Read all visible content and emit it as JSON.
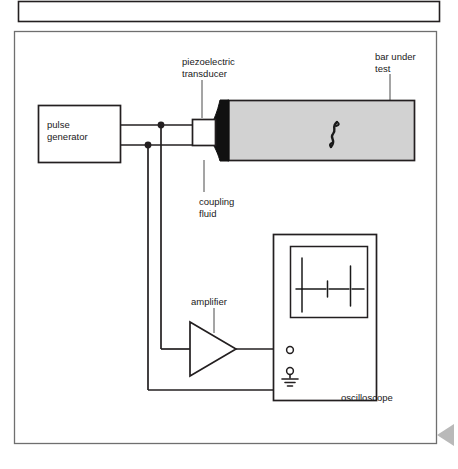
{
  "figure": {
    "kind": "ultrasonic-pulse-echo-test-setup-diagram",
    "background_color": "#ffffff",
    "line_color": "#231f20",
    "bar_fill_color": "#d2d2d2",
    "coupling_fluid_color": "#111111",
    "marker_color": "#b9b9b9"
  },
  "top_panel": {
    "present": true,
    "x": 18,
    "y": 1,
    "width": 422,
    "height": 21,
    "content": ""
  },
  "frame": {
    "x": 14,
    "y": 31,
    "width": 423,
    "height": 413
  },
  "labels": {
    "piezoelectric_transducer": "piezoelectric\ntransducer",
    "bar_under_test": "bar under\ntest",
    "coupling_fluid": "coupling\nfluid",
    "pulse_generator": "pulse\ngenerator",
    "amplifier": "amplifier",
    "oscilloscope": "oscilloscope"
  },
  "label_positions": {
    "piezoelectric_transducer": {
      "x": 182,
      "y": 56,
      "width": 80,
      "align": "left"
    },
    "bar_under_test": {
      "x": 375,
      "y": 51,
      "width": 72,
      "align": "left"
    },
    "coupling_fluid": {
      "x": 199,
      "y": 196,
      "width": 70,
      "align": "left"
    },
    "pulse_generator": {
      "x": 44,
      "y": 121,
      "width": 60,
      "align": "left"
    },
    "amplifier": {
      "x": 191,
      "y": 297,
      "width": 60,
      "align": "left"
    },
    "oscilloscope": {
      "x": 340,
      "y": 393,
      "width": 72,
      "align": "left"
    }
  },
  "components": {
    "pulse_generator_box": {
      "x": 38,
      "y": 105,
      "width": 83,
      "height": 58
    },
    "transducer_box": {
      "x": 192,
      "y": 119,
      "width": 24,
      "height": 27
    },
    "bar": {
      "x": 228,
      "y": 100,
      "width": 187,
      "height": 61
    },
    "oscilloscope_box": {
      "x": 273,
      "y": 234,
      "width": 104,
      "height": 167
    },
    "oscilloscope_screen": {
      "x": 290,
      "y": 246,
      "width": 78,
      "height": 72
    },
    "amplifier_triangle": {
      "x": 189,
      "y": 322,
      "width": 47,
      "height": 54
    }
  },
  "terminals": {
    "signal": {
      "x": 290,
      "y": 350,
      "r": 3.2,
      "label": "signal-terminal"
    },
    "ground": {
      "x": 290,
      "y": 371,
      "r": 3.2,
      "label": "ground-terminal"
    }
  },
  "junction_dots": [
    {
      "x": 161,
      "y": 125,
      "r": 3.4
    },
    {
      "x": 148,
      "y": 145,
      "r": 3.4
    }
  ],
  "wave_symbol": {
    "inside": "bar",
    "glyph": "lightning-wave",
    "x": 334,
    "y": 134
  },
  "oscilloscope_trace": {
    "description": "pulse-echo trace: large initial pulse, small echo, medium echo",
    "baseline_y": 289,
    "spikes": [
      {
        "x": 302,
        "top": 258,
        "bottom": 312,
        "name": "initial-pulse"
      },
      {
        "x": 328,
        "top": 281,
        "bottom": 297,
        "name": "first-echo"
      },
      {
        "x": 350,
        "top": 266,
        "bottom": 306,
        "name": "second-echo"
      }
    ],
    "trace_start_x": 296,
    "trace_end_x": 364
  },
  "corner_marker": {
    "shape": "left-pointing-triangle",
    "x": 437,
    "y": 424,
    "width": 17,
    "height": 22
  }
}
